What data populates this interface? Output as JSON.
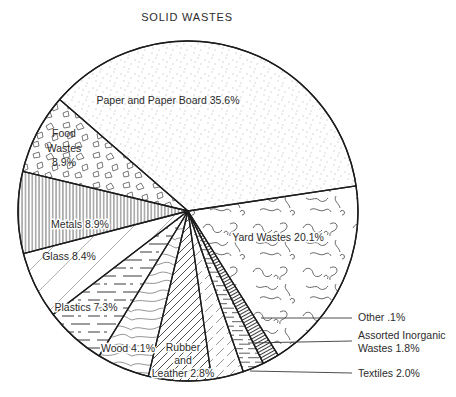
{
  "chart_data": {
    "type": "pie",
    "title": "SOLID WASTES",
    "unit": "percent of total solid waste",
    "legend_position": "none",
    "slices": [
      {
        "id": "paper",
        "label": "Paper and Paper Board",
        "value": 35.6,
        "lines": [
          "Paper and Paper Board 35.6%"
        ],
        "texture": "dot-stipple",
        "label_placement": "inside"
      },
      {
        "id": "food",
        "label": "Food Wastes",
        "value": 8.9,
        "lines": [
          "Food",
          "Wastes",
          "8.9%"
        ],
        "texture": "debris-outline",
        "label_placement": "inside"
      },
      {
        "id": "metals",
        "label": "Metals",
        "value": 8.9,
        "lines": [
          "Metals 8.9%"
        ],
        "texture": "vertical-lines",
        "label_placement": "inside"
      },
      {
        "id": "glass",
        "label": "Glass",
        "value": 8.4,
        "lines": [
          "Glass 8.4%"
        ],
        "texture": "sparse-diagonal-lines",
        "label_placement": "inside"
      },
      {
        "id": "plastics",
        "label": "Plastics",
        "value": 7.3,
        "lines": [
          "Plastics 7.3%"
        ],
        "texture": "dashed-horizontal-lines",
        "label_placement": "inside"
      },
      {
        "id": "wood",
        "label": "Wood",
        "value": 4.1,
        "lines": [
          "Wood 4.1%"
        ],
        "texture": "wood-grain-waves",
        "label_placement": "inside"
      },
      {
        "id": "rubber",
        "label": "Rubber and Leather",
        "value": 2.8,
        "lines": [
          "Rubber",
          "and",
          "Leather 2.8%"
        ],
        "texture": "diagonal-hatch",
        "label_placement": "inside"
      },
      {
        "id": "textiles",
        "label": "Textiles",
        "value": 2.0,
        "lines": [
          "Textiles 2.0%"
        ],
        "texture": "dashed-diagonal-hatch",
        "label_placement": "callout-right"
      },
      {
        "id": "assorted",
        "label": "Assorted Inorganic Wastes",
        "value": 1.8,
        "lines": [
          "Assorted Inorganic",
          "Wastes 1.8%"
        ],
        "texture": "short-horizontal-lines",
        "label_placement": "callout-right"
      },
      {
        "id": "other",
        "label": "Other",
        "value": 0.1,
        "lines": [
          "Other .1%"
        ],
        "texture": "dense-cross-rungs",
        "label_placement": "callout-right"
      },
      {
        "id": "yard",
        "label": "Yard Wastes",
        "value": 20.1,
        "lines": [
          "Yard Wastes 20.1%"
        ],
        "texture": "squiggle-curls",
        "label_placement": "inside"
      }
    ]
  }
}
